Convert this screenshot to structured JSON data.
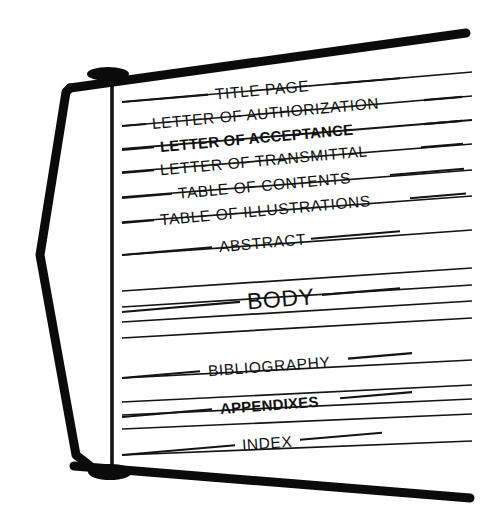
{
  "diagram": {
    "type": "bound-report-sections",
    "background_color": "#ffffff",
    "ink_color": "#141414",
    "frame_color": "#0b0b0b"
  },
  "binder": {
    "spine_label": "binder-spine",
    "top_post_label": "top-binding-post",
    "bottom_post_label": "bottom-binding-post",
    "top_bar_label": "top-frame-bar",
    "bottom_bar_label": "bottom-frame-bar",
    "side_bar_label": "left-frame-bar"
  },
  "sections": [
    {
      "id": "title-page",
      "label": "TITLE PAGE",
      "bold": false,
      "y": 102,
      "text_x": 215,
      "text_anchor": "start",
      "lead_left_x": 122,
      "lead_left_end": 208,
      "lead_right_start": 332,
      "lead_right_end": 400,
      "font_size": 15.5,
      "rotate": -5.2
    },
    {
      "id": "letter-authorization",
      "label": "LETTER OF AUTHORIZATION",
      "bold": false,
      "y": 126,
      "text_x": 152,
      "text_anchor": "start",
      "lead_left_x": 122,
      "lead_left_end": 146,
      "lead_right_start": 424,
      "lead_right_end": 462,
      "font_size": 15.5,
      "rotate": -5.2
    },
    {
      "id": "letter-acceptance",
      "label": "LETTER OF ACCEPTANCE",
      "bold": true,
      "y": 150,
      "text_x": 160,
      "text_anchor": "start",
      "lead_left_x": 122,
      "lead_left_end": 154,
      "lead_right_start": 424,
      "lead_right_end": 462,
      "font_size": 15.0,
      "rotate": -5.2
    },
    {
      "id": "letter-transmittal",
      "label": "LETTER OF TRANSMITTAL",
      "bold": false,
      "y": 173,
      "text_x": 160,
      "text_anchor": "start",
      "lead_left_x": 122,
      "lead_left_end": 154,
      "lead_right_start": 421,
      "lead_right_end": 463,
      "font_size": 15.5,
      "rotate": -5.2
    },
    {
      "id": "table-of-contents",
      "label": "TABLE OF CONTENTS",
      "bold": false,
      "y": 198,
      "text_x": 178,
      "text_anchor": "start",
      "lead_left_x": 122,
      "lead_left_end": 172,
      "lead_right_start": 390,
      "lead_right_end": 464,
      "font_size": 15.5,
      "rotate": -5.2
    },
    {
      "id": "table-of-illustrations",
      "label": "TABLE OF ILLUSTRATIONS",
      "bold": false,
      "y": 223,
      "text_x": 160,
      "text_anchor": "start",
      "lead_left_x": 122,
      "lead_left_end": 154,
      "lead_right_start": 410,
      "lead_right_end": 466,
      "font_size": 15.5,
      "rotate": -5.2
    },
    {
      "id": "abstract",
      "label": "ABSTRACT",
      "bold": false,
      "y": 255,
      "text_x": 219,
      "text_anchor": "start",
      "lead_left_x": 122,
      "lead_left_end": 212,
      "lead_right_start": 311,
      "lead_right_end": 400,
      "font_size": 15.5,
      "rotate": -5.2
    },
    {
      "id": "body",
      "label": "BODY",
      "bold": false,
      "y": 312,
      "text_x": 247,
      "text_anchor": "start",
      "lead_left_x": 122,
      "lead_left_end": 240,
      "lead_right_start": 322,
      "lead_right_end": 400,
      "font_size": 23.0,
      "rotate": -4.6
    },
    {
      "id": "bibliography",
      "label": "BIBLIOGRAPHY",
      "bold": false,
      "y": 378,
      "text_x": 208,
      "text_anchor": "start",
      "lead_left_x": 122,
      "lead_left_end": 200,
      "lead_right_start": 348,
      "lead_right_end": 412,
      "font_size": 15.5,
      "rotate": -4.2
    },
    {
      "id": "appendixes",
      "label": "APPENDIXES",
      "bold": true,
      "y": 417,
      "text_x": 220,
      "text_anchor": "start",
      "lead_left_x": 122,
      "lead_left_end": 212,
      "lead_right_start": 340,
      "lead_right_end": 412,
      "font_size": 15.0,
      "rotate": -4.2
    },
    {
      "id": "index",
      "label": "INDEX",
      "bold": false,
      "y": 455,
      "text_x": 242,
      "text_anchor": "start",
      "lead_left_x": 122,
      "lead_left_end": 235,
      "lead_right_start": 300,
      "lead_right_end": 382,
      "font_size": 15.5,
      "rotate": -4.0
    }
  ],
  "page_edges": [
    {
      "id": "edge-1",
      "y_left": 102,
      "y_right": 72,
      "weight": 1.7
    },
    {
      "id": "edge-2",
      "y_left": 126,
      "y_right": 96,
      "weight": 1.7
    },
    {
      "id": "edge-3",
      "y_left": 149,
      "y_right": 120,
      "weight": 1.9
    },
    {
      "id": "edge-4",
      "y_left": 172,
      "y_right": 144,
      "weight": 1.7
    },
    {
      "id": "edge-5",
      "y_left": 197,
      "y_right": 170,
      "weight": 1.7
    },
    {
      "id": "edge-6",
      "y_left": 222,
      "y_right": 196,
      "weight": 1.7
    },
    {
      "id": "edge-7",
      "y_left": 255,
      "y_right": 230,
      "weight": 1.7
    },
    {
      "id": "edge-8",
      "y_left": 291,
      "y_right": 268,
      "weight": 1.7
    },
    {
      "id": "edge-9",
      "y_left": 307,
      "y_right": 285,
      "weight": 1.7
    },
    {
      "id": "edge-10",
      "y_left": 322,
      "y_right": 301,
      "weight": 1.7
    },
    {
      "id": "edge-11",
      "y_left": 338,
      "y_right": 318,
      "weight": 1.7
    },
    {
      "id": "edge-12",
      "y_left": 378,
      "y_right": 360,
      "weight": 1.7
    },
    {
      "id": "edge-13",
      "y_left": 402,
      "y_right": 385,
      "weight": 1.7
    },
    {
      "id": "edge-14",
      "y_left": 415,
      "y_right": 399,
      "weight": 1.7
    },
    {
      "id": "edge-15",
      "y_left": 429,
      "y_right": 414,
      "weight": 1.7
    },
    {
      "id": "edge-16",
      "y_left": 455,
      "y_right": 441,
      "weight": 1.7
    }
  ],
  "geometry": {
    "page_left_x": 122,
    "page_right_x": 472,
    "spine_x": 112,
    "spine_top_y": 74,
    "spine_bottom_y": 474,
    "top_post": {
      "cx": 108,
      "cy": 74,
      "rx": 21,
      "ry": 7
    },
    "bottom_post": {
      "cx": 110,
      "cy": 472,
      "rx": 22,
      "ry": 8
    },
    "top_bar": {
      "x1": 70,
      "y1": 88,
      "x2": 466,
      "y2": 33,
      "weight": 9
    },
    "bottom_bar": {
      "x1": 74,
      "y1": 466,
      "x2": 470,
      "y2": 498,
      "weight": 9
    },
    "side_bar_points": "70,88 66,92 40,255 76,455 90,466",
    "side_bar_weight": 9
  }
}
